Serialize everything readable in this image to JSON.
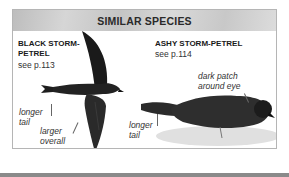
{
  "panel": {
    "title": "SIMILAR SPECIES",
    "species": [
      {
        "name_line1": "BLACK STORM-",
        "name_line2": "PETREL",
        "reference": "see p.113",
        "labels": [
          {
            "line1": "longer",
            "line2": "tail"
          },
          {
            "line1": "larger",
            "line2": "overall"
          }
        ]
      },
      {
        "name_line1": "ASHY STORM-PETREL",
        "reference": "see p.114",
        "labels": [
          {
            "line1": "dark patch",
            "line2": "around eye"
          },
          {
            "line1": "longer",
            "line2": "tail"
          }
        ]
      }
    ]
  }
}
